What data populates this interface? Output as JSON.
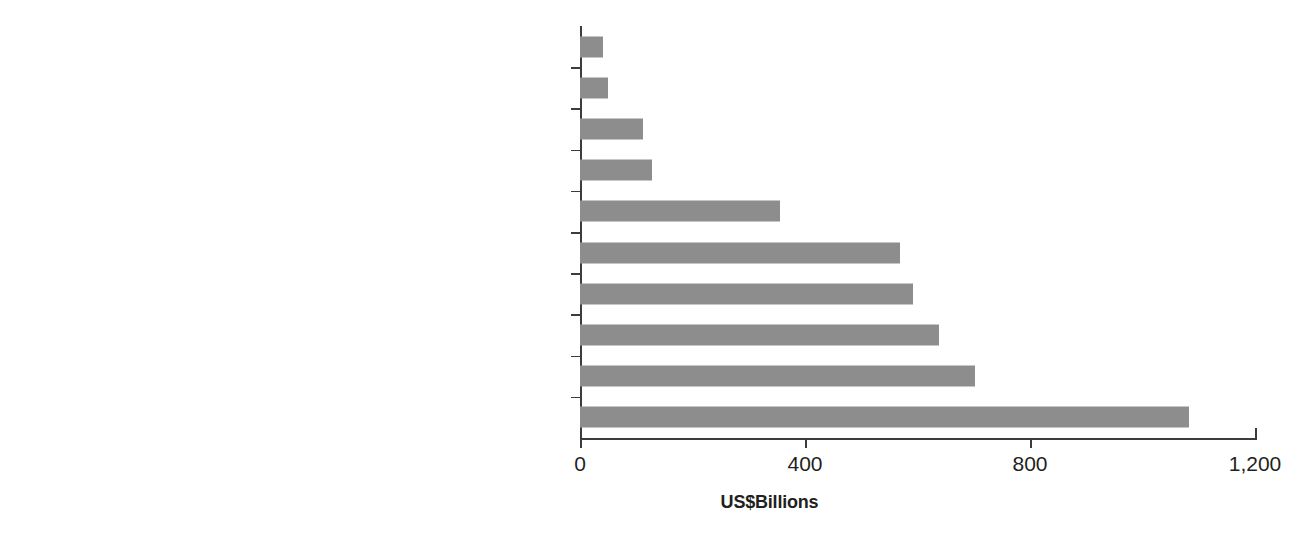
{
  "chart_data": {
    "type": "bar",
    "orientation": "horizontal",
    "title": "",
    "xlabel": "US$Billions",
    "ylabel": "",
    "xlim": [
      0,
      1200
    ],
    "xticks": [
      "0",
      "400",
      "800",
      "1,200"
    ],
    "xtick_values": [
      0,
      400,
      800,
      1200
    ],
    "grid": false,
    "legend": false,
    "bar_color": "#8d8d8d",
    "axis_color": "#3c3c3c",
    "text_color": "#231f20",
    "categories": [
      "Workplace Wellness",
      "Thermal/Mineral Springs",
      "Spa Economy",
      "Wellness Lifestyle Real Estate",
      "Traditional & Complementary Medicine",
      "Preventative & Personalized Medicine and Public Health",
      "Fitness & Mind-Body",
      "Wellness Tourism",
      "Healthy Eating, Nutrition & Weight Loss",
      "Personal Care, Beauty & Anti-Aging"
    ],
    "values": [
      40,
      50,
      112,
      128,
      355,
      569,
      592,
      639,
      702,
      1083
    ]
  }
}
